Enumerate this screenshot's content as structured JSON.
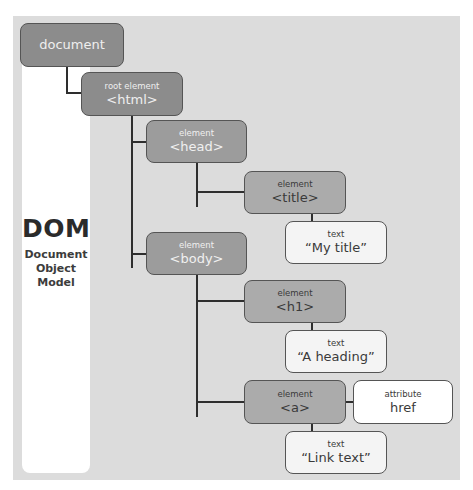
{
  "label": {
    "acronym": "DOM",
    "expansion": [
      "Document",
      "Object",
      "Model"
    ]
  },
  "nodes": {
    "document": {
      "type": "",
      "name": "document"
    },
    "html": {
      "type": "root element",
      "name": "<html>"
    },
    "head": {
      "type": "element",
      "name": "<head>"
    },
    "title": {
      "type": "element",
      "name": "<title>"
    },
    "title_text": {
      "type": "text",
      "name": "“My title”"
    },
    "body": {
      "type": "element",
      "name": "<body>"
    },
    "h1": {
      "type": "element",
      "name": "<h1>"
    },
    "h1_text": {
      "type": "text",
      "name": "“A heading”"
    },
    "a": {
      "type": "element",
      "name": "<a>"
    },
    "a_attr": {
      "type": "attribute",
      "name": "href"
    },
    "a_text": {
      "type": "text",
      "name": "“Link text”"
    }
  },
  "colors": {
    "panel": "#dcdcdc",
    "document_node": "#8c8c8c",
    "level2_node": "#9c9c9c",
    "level3_node": "#ababab",
    "text_node": "#f4f4f4",
    "attribute_node": "#ffffff",
    "connector": "#2e2e2e"
  }
}
